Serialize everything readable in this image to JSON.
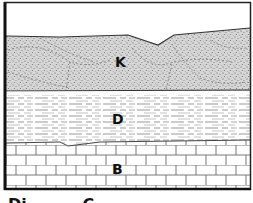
{
  "diagram": {
    "type": "geologic-cross-section",
    "colors": {
      "frame": "#111111",
      "background": "#ffffff",
      "sandstone_fill": "#d9d9d9",
      "stipple": "#666666",
      "line": "#333333"
    },
    "layers": [
      {
        "id": "K",
        "label": "K",
        "pattern": "stippled-sandstone-cross-bedded",
        "position": "top"
      },
      {
        "id": "D",
        "label": "D",
        "pattern": "dashed-shale",
        "position": "middle"
      },
      {
        "id": "B",
        "label": "B",
        "pattern": "brick-limestone",
        "position": "bottom"
      }
    ],
    "caption_partial": "Di          C"
  }
}
